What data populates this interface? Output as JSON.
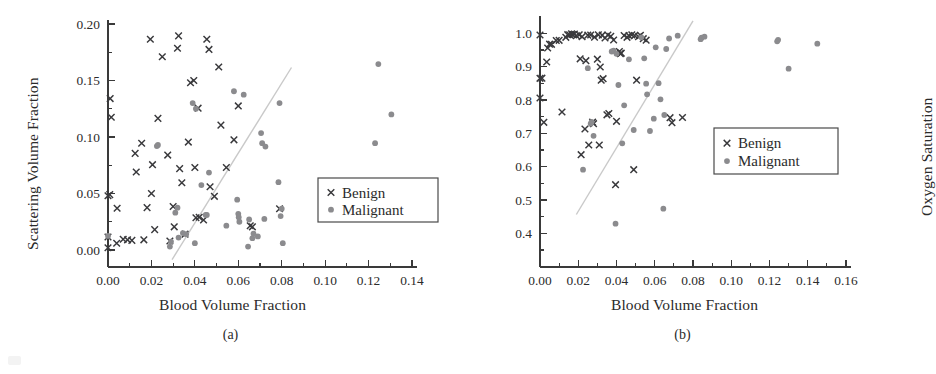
{
  "figure": {
    "panels": [
      {
        "tag": "(a)",
        "xlabel": "Blood Volume Fraction",
        "ylabel": "Scattering Volume Fraction",
        "legend": {
          "benign": "Benign",
          "malignant": "Malignant"
        }
      },
      {
        "tag": "(b)",
        "xlabel": "Blood Volume Fraction",
        "ylabel": "Oxygen Saturation",
        "legend": {
          "benign": "Benign",
          "malignant": "Malignant"
        }
      }
    ],
    "colors": {
      "benign_marker": "#39393c",
      "malignant_marker": "#8b8b8e",
      "axis": "#3a3a3a",
      "fit_line": "#c9c9c9",
      "text": "#2b2b2b",
      "background": "#ffffff"
    }
  },
  "chart_data": [
    {
      "type": "scatter",
      "panel": "(a)",
      "title": "",
      "xlabel": "Blood Volume Fraction",
      "ylabel": "Scattering Volume Fraction",
      "xlim": [
        0.0,
        0.14
      ],
      "ylim": [
        0.0,
        0.2
      ],
      "xticks": [
        "0.00",
        "0.02",
        "0.04",
        "0.06",
        "0.08",
        "0.10",
        "0.12",
        "0.14"
      ],
      "xtick_values": [
        0.0,
        0.02,
        0.04,
        0.06,
        0.08,
        0.1,
        0.12,
        0.14
      ],
      "yticks": [
        "0.00",
        "0.05",
        "0.10",
        "0.15",
        "0.20"
      ],
      "ytick_values": [
        0.0,
        0.05,
        0.1,
        0.15,
        0.2
      ],
      "minor_tick_x": 0.01,
      "minor_tick_y": 0.025,
      "grid": false,
      "legend_position": "right-middle",
      "annotations": [
        "(a)"
      ],
      "series": [
        {
          "name": "Benign",
          "marker": "x",
          "color": "#39393c",
          "points": [
            [
              0.0,
              0.002
            ],
            [
              0.0,
              0.0115
            ],
            [
              0.0,
              0.048
            ],
            [
              0.0008,
              0.049
            ],
            [
              0.001,
              0.134
            ],
            [
              0.0015,
              0.1175
            ],
            [
              0.004,
              0.006
            ],
            [
              0.0042,
              0.037
            ],
            [
              0.007,
              0.0095
            ],
            [
              0.009,
              0.009
            ],
            [
              0.011,
              0.0085
            ],
            [
              0.0125,
              0.0855
            ],
            [
              0.013,
              0.069
            ],
            [
              0.0155,
              0.0945
            ],
            [
              0.0165,
              0.009
            ],
            [
              0.018,
              0.0375
            ],
            [
              0.0195,
              0.1865
            ],
            [
              0.02,
              0.05
            ],
            [
              0.0205,
              0.0755
            ],
            [
              0.0215,
              0.018
            ],
            [
              0.023,
              0.1165
            ],
            [
              0.025,
              0.171
            ],
            [
              0.0275,
              0.084
            ],
            [
              0.0285,
              0.008
            ],
            [
              0.03,
              0.0385
            ],
            [
              0.0305,
              0.0205
            ],
            [
              0.032,
              0.1785
            ],
            [
              0.0325,
              0.1895
            ],
            [
              0.033,
              0.072
            ],
            [
              0.034,
              0.0595
            ],
            [
              0.0355,
              0.014
            ],
            [
              0.037,
              0.0955
            ],
            [
              0.038,
              0.148
            ],
            [
              0.0395,
              0.15
            ],
            [
              0.04,
              0.073
            ],
            [
              0.0405,
              0.0285
            ],
            [
              0.0415,
              0.1255
            ],
            [
              0.042,
              0.029
            ],
            [
              0.044,
              0.0265
            ],
            [
              0.0455,
              0.1865
            ],
            [
              0.0465,
              0.1775
            ],
            [
              0.047,
              0.056
            ],
            [
              0.049,
              0.0475
            ],
            [
              0.051,
              0.162
            ],
            [
              0.052,
              0.1105
            ],
            [
              0.0545,
              0.073
            ],
            [
              0.058,
              0.0975
            ],
            [
              0.06,
              0.1275
            ],
            [
              0.0655,
              0.0215
            ],
            [
              0.0665,
              0.0205
            ],
            [
              0.079,
              0.0365
            ]
          ]
        },
        {
          "name": "Malignant",
          "marker": "o",
          "color": "#8b8b8e",
          "points": [
            [
              0.0,
              0.0125
            ],
            [
              0.0225,
              0.092
            ],
            [
              0.023,
              0.093
            ],
            [
              0.0285,
              0.003
            ],
            [
              0.029,
              0.0075
            ],
            [
              0.031,
              0.033
            ],
            [
              0.032,
              0.0375
            ],
            [
              0.0325,
              0.011
            ],
            [
              0.0345,
              0.015
            ],
            [
              0.036,
              0.014
            ],
            [
              0.039,
              0.13
            ],
            [
              0.04,
              0.006
            ],
            [
              0.0405,
              0.125
            ],
            [
              0.043,
              0.0575
            ],
            [
              0.045,
              0.031
            ],
            [
              0.0455,
              0.031
            ],
            [
              0.0465,
              0.0685
            ],
            [
              0.0545,
              0.0215
            ],
            [
              0.058,
              0.1405
            ],
            [
              0.0595,
              0.0445
            ],
            [
              0.06,
              0.032
            ],
            [
              0.0602,
              0.029
            ],
            [
              0.0605,
              0.025
            ],
            [
              0.0625,
              0.1375
            ],
            [
              0.0645,
              0.003
            ],
            [
              0.065,
              0.027
            ],
            [
              0.0665,
              0.0105
            ],
            [
              0.067,
              0.0145
            ],
            [
              0.069,
              0.012
            ],
            [
              0.0705,
              0.1035
            ],
            [
              0.071,
              0.0945
            ],
            [
              0.072,
              0.0275
            ],
            [
              0.0725,
              0.0915
            ],
            [
              0.0785,
              0.06
            ],
            [
              0.079,
              0.13
            ],
            [
              0.0795,
              0.03
            ],
            [
              0.08,
              0.0365
            ],
            [
              0.0805,
              0.006
            ],
            [
              0.123,
              0.0945
            ],
            [
              0.1245,
              0.1645
            ],
            [
              0.1305,
              0.12
            ]
          ]
        }
      ],
      "fit_line": {
        "x0": 0.0295,
        "y0": -0.0085,
        "x1": 0.0845,
        "y1": 0.1615
      }
    },
    {
      "type": "scatter",
      "panel": "(b)",
      "title": "",
      "xlabel": "Blood Volume Fraction",
      "ylabel": "Oxygen Saturation",
      "xlim": [
        0.0,
        0.16
      ],
      "ylim": [
        0.35,
        1.04
      ],
      "xticks": [
        "0.00",
        "0.02",
        "0.04",
        "0.06",
        "0.08",
        "0.10",
        "0.12",
        "0.14",
        "0.16"
      ],
      "xtick_values": [
        0.0,
        0.02,
        0.04,
        0.06,
        0.08,
        0.1,
        0.12,
        0.14,
        0.16
      ],
      "yticks": [
        "0.4",
        "0.5",
        "0.6",
        "0.7",
        "0.8",
        "0.9",
        "1.0"
      ],
      "ytick_values": [
        0.4,
        0.5,
        0.6,
        0.7,
        0.8,
        0.9,
        1.0
      ],
      "minor_tick_x": 0.01,
      "minor_tick_y": 0.05,
      "grid": false,
      "legend_position": "right-middle",
      "annotations": [
        "(b)"
      ],
      "series": [
        {
          "name": "Benign",
          "marker": "x",
          "color": "#39393c",
          "points": [
            [
              0.0,
              0.995
            ],
            [
              0.0,
              0.865
            ],
            [
              0.0,
              0.806
            ],
            [
              0.001,
              0.8655
            ],
            [
              0.002,
              0.733
            ],
            [
              0.0035,
              0.914
            ],
            [
              0.004,
              0.956
            ],
            [
              0.005,
              0.9675
            ],
            [
              0.006,
              0.967
            ],
            [
              0.0085,
              0.9785
            ],
            [
              0.01,
              0.979
            ],
            [
              0.0115,
              0.764
            ],
            [
              0.0135,
              0.988
            ],
            [
              0.0145,
              0.996
            ],
            [
              0.0155,
              0.9955
            ],
            [
              0.0165,
              0.9985
            ],
            [
              0.017,
              0.9965
            ],
            [
              0.018,
              0.998
            ],
            [
              0.019,
              0.993
            ],
            [
              0.0205,
              0.9955
            ],
            [
              0.021,
              0.9235
            ],
            [
              0.0215,
              0.636
            ],
            [
              0.022,
              0.99
            ],
            [
              0.0235,
              0.713
            ],
            [
              0.024,
              0.918
            ],
            [
              0.025,
              0.9945
            ],
            [
              0.0255,
              0.665
            ],
            [
              0.0265,
              0.995
            ],
            [
              0.0275,
              0.7335
            ],
            [
              0.028,
              0.729
            ],
            [
              0.0285,
              0.9885
            ],
            [
              0.03,
              0.9225
            ],
            [
              0.0305,
              0.9955
            ],
            [
              0.031,
              0.665
            ],
            [
              0.0315,
              0.899
            ],
            [
              0.032,
              0.8595
            ],
            [
              0.0325,
              0.9945
            ],
            [
              0.033,
              0.864
            ],
            [
              0.034,
              0.986
            ],
            [
              0.035,
              0.7555
            ],
            [
              0.0355,
              0.995
            ],
            [
              0.036,
              0.7595
            ],
            [
              0.037,
              0.991
            ],
            [
              0.0385,
              0.98
            ],
            [
              0.0395,
              0.546
            ],
            [
              0.04,
              0.736
            ],
            [
              0.0415,
              0.9455
            ],
            [
              0.042,
              0.939
            ],
            [
              0.0425,
              0.9405
            ],
            [
              0.044,
              0.9935
            ],
            [
              0.0455,
              0.988
            ],
            [
              0.0465,
              0.993
            ],
            [
              0.048,
              0.9955
            ],
            [
              0.049,
              0.591
            ],
            [
              0.0495,
              0.9935
            ],
            [
              0.0505,
              0.8595
            ],
            [
              0.0515,
              0.99
            ],
            [
              0.0525,
              0.994
            ],
            [
              0.054,
              0.984
            ],
            [
              0.0555,
              0.9795
            ],
            [
              0.068,
              0.747
            ],
            [
              0.069,
              0.732
            ],
            [
              0.0745,
              0.7475
            ]
          ]
        },
        {
          "name": "Malignant",
          "marker": "o",
          "color": "#8b8b8e",
          "points": [
            [
              0.0225,
              0.591
            ],
            [
              0.025,
              0.8955
            ],
            [
              0.0265,
              0.729
            ],
            [
              0.027,
              0.734
            ],
            [
              0.028,
              0.6925
            ],
            [
              0.0375,
              0.9455
            ],
            [
              0.0385,
              0.948
            ],
            [
              0.0395,
              0.429
            ],
            [
              0.04,
              0.9385
            ],
            [
              0.041,
              0.845
            ],
            [
              0.043,
              0.67
            ],
            [
              0.044,
              0.784
            ],
            [
              0.0465,
              0.922
            ],
            [
              0.049,
              0.71
            ],
            [
              0.053,
              0.988
            ],
            [
              0.0545,
              0.925
            ],
            [
              0.0555,
              0.849
            ],
            [
              0.056,
              0.817
            ],
            [
              0.0575,
              0.707
            ],
            [
              0.0595,
              0.744
            ],
            [
              0.0605,
              0.958
            ],
            [
              0.062,
              0.8505
            ],
            [
              0.063,
              0.802
            ],
            [
              0.0645,
              0.474
            ],
            [
              0.065,
              0.755
            ],
            [
              0.066,
              0.953
            ],
            [
              0.0675,
              0.9845
            ],
            [
              0.072,
              0.993
            ],
            [
              0.084,
              0.9825
            ],
            [
              0.0845,
              0.987
            ],
            [
              0.086,
              0.99
            ],
            [
              0.124,
              0.976
            ],
            [
              0.1245,
              0.9805
            ],
            [
              0.13,
              0.894
            ],
            [
              0.145,
              0.969
            ]
          ]
        }
      ],
      "fit_line": {
        "x0": 0.019,
        "y0": 0.4565,
        "x1": 0.08,
        "y1": 1.0375
      }
    }
  ]
}
